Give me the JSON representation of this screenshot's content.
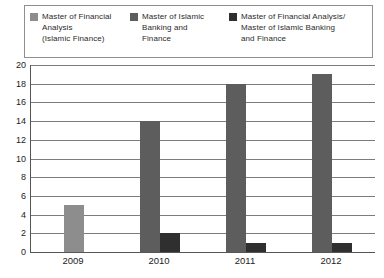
{
  "legend": {
    "items": [
      {
        "label": "Master of Financial\nAnalysis\n(Islamic Finance)"
      },
      {
        "label": "Master of Islamic\nBanking and\nFinance"
      },
      {
        "label": "Master of Financial Analysis/\nMaster of Islamic Banking\nand Finance"
      }
    ]
  },
  "chart_data": {
    "type": "bar",
    "categories": [
      "2009",
      "2010",
      "2011",
      "2012"
    ],
    "series": [
      {
        "name": "Master of Financial Analysis (Islamic Finance)",
        "color": "#8d8d8d",
        "values": [
          5,
          0,
          0,
          0
        ]
      },
      {
        "name": "Master of Islamic Banking and Finance",
        "color": "#5d5d5d",
        "values": [
          0,
          14,
          18,
          19
        ]
      },
      {
        "name": "Master of Financial Analysis/ Master of Islamic Banking and Finance",
        "color": "#2f2f2f",
        "values": [
          0,
          2,
          1,
          1
        ]
      }
    ],
    "title": "",
    "xlabel": "",
    "ylabel": "",
    "ylim": [
      0,
      20
    ],
    "ytick_step": 2,
    "grid": true,
    "legend_position": "top",
    "bar_width": 20
  }
}
